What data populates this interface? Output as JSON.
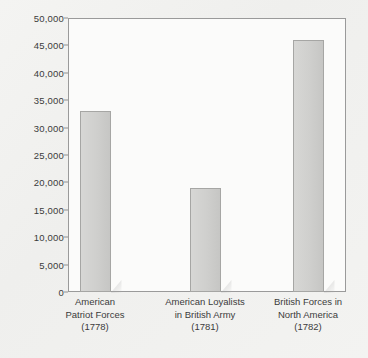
{
  "chart_data": {
    "type": "bar",
    "title": "",
    "subtitle": "",
    "xlabel": "",
    "ylabel": "",
    "ylim": [
      0,
      50000
    ],
    "grid": false,
    "legend": null,
    "categories": [
      "American Patriot Forces (1778)",
      "American Loyalists in British Army (1781)",
      "British Forces in North America (1782)"
    ],
    "values": [
      33000,
      19000,
      46000
    ],
    "y_ticks": [
      0,
      5000,
      10000,
      15000,
      20000,
      25000,
      30000,
      35000,
      40000,
      45000,
      50000
    ],
    "y_tick_labels": [
      "0",
      "5,000",
      "10,000",
      "15,000",
      "20,000",
      "25,000",
      "30,000",
      "35,000",
      "40,000",
      "45,000",
      "50,000"
    ],
    "bars": [
      {
        "label_lines": [
          "American",
          "Patriot Forces",
          "(1778)"
        ],
        "value": 33000
      },
      {
        "label_lines": [
          "American Loyalists",
          "in British Army",
          "(1781)"
        ],
        "value": 19000
      },
      {
        "label_lines": [
          "British Forces in",
          "North America",
          "(1782)"
        ],
        "value": 46000
      }
    ]
  },
  "colors": {
    "bar_fill": "#d0d0ce",
    "bar_outline": "#a6a6a4",
    "plot_border": "#9a9a9a",
    "plot_background": "#fbfbfa",
    "page_background": "#f2f2f0",
    "text": "#3b3b3b"
  }
}
